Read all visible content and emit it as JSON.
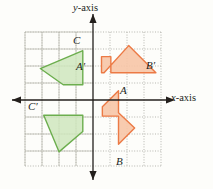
{
  "figure": {
    "background_color": "#fdfdfa",
    "axis_color": "#231f1c",
    "grid_color": "#b9b9ae",
    "grid_dot_color": "#8e8e84"
  },
  "axes": {
    "x_label": "x-axis",
    "x_label_italic_part": "x",
    "x_label_rest": "-axis",
    "y_label": "y-axis",
    "y_label_italic_part": "y",
    "y_label_rest": "-axis",
    "origin_px": [
      93,
      100
    ],
    "unit_px": 17,
    "x_range": [
      -4,
      4
    ],
    "y_range": [
      -4,
      4
    ],
    "grid": true,
    "grid_style": "dotted squares with solid major lines"
  },
  "shapes": [
    {
      "id": "orange-preimage",
      "name": "arrow-ABA-preimage",
      "color_fill": "#f7c5a6",
      "color_stroke": "#ec7a45",
      "quadrant": 4,
      "points_units": [
        [
          1.5,
          0.55
        ],
        [
          0.55,
          -0.4
        ],
        [
          0.55,
          -0.95
        ],
        [
          1.5,
          -0.95
        ],
        [
          1.5,
          -2.6
        ],
        [
          2.45,
          -1.65
        ],
        [
          1.5,
          -0.75
        ]
      ],
      "points_px": "118.5,90.65 102.35,106.8 102.35,116.15 118.5,116.15 118.5,144.2 134.65,128.05 118.5,112.75"
    },
    {
      "id": "orange-image",
      "name": "arrow-ABA-image",
      "color_fill": "#f7c5a6",
      "color_stroke": "#ec7a45",
      "quadrant": 1,
      "points_units": [
        [
          0.5,
          1.6
        ],
        [
          0.5,
          2.55
        ],
        [
          1.05,
          2.55
        ],
        [
          1.05,
          1.6
        ],
        [
          3.7,
          1.6
        ],
        [
          2.1,
          3.2
        ],
        [
          0.65,
          1.6
        ]
      ],
      "points_px": "101.5,72.8 101.5,56.65 110.85,56.65 110.85,72.8 155.9,72.8 128.7,45.6 104.05,72.8"
    },
    {
      "id": "green-image",
      "name": "quadrilateral-C-image",
      "color_fill": "#cfe6bd",
      "color_stroke": "#6cae4e",
      "quadrant": 2,
      "points_units": [
        [
          -0.6,
          2.9
        ],
        [
          -0.6,
          0.9
        ],
        [
          -1.75,
          0.9
        ],
        [
          -3.1,
          1.85
        ]
      ],
      "points_px": "82.8,50.7 82.8,84.7 63.25,84.7 40.3,68.55"
    },
    {
      "id": "green-preimage",
      "name": "quadrilateral-C-preimage",
      "color_fill": "#cfe6bd",
      "color_stroke": "#6cae4e",
      "quadrant": 3,
      "points_units": [
        [
          -0.6,
          -0.9
        ],
        [
          -2.9,
          -0.9
        ],
        [
          -2.0,
          -3.05
        ],
        [
          -0.6,
          -1.85
        ]
      ],
      "points_px": "82.8,115.3 43.7,115.3 59,151.85 82.8,131.45"
    }
  ],
  "labels": [
    {
      "id": "label-C",
      "text": "C",
      "x_px": 73,
      "y_px": 35,
      "shape": "green-image"
    },
    {
      "id": "label-A-prime",
      "text": "A′",
      "x_px": 76,
      "y_px": 61,
      "shape": "orange-image"
    },
    {
      "id": "label-B-prime",
      "text": "B′",
      "x_px": 146,
      "y_px": 60,
      "shape": "orange-image"
    },
    {
      "id": "label-A",
      "text": "A",
      "x_px": 120,
      "y_px": 85,
      "shape": "orange-preimage"
    },
    {
      "id": "label-B",
      "text": "B",
      "x_px": 116,
      "y_px": 156,
      "shape": "orange-preimage"
    },
    {
      "id": "label-C-prime",
      "text": "C′",
      "x_px": 28,
      "y_px": 101,
      "shape": "green-preimage"
    }
  ],
  "axis_label_positions": {
    "x_label_px": [
      171,
      93
    ],
    "y_label_px": [
      73,
      3
    ]
  }
}
